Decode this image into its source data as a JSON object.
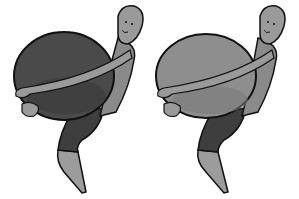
{
  "illustration": {
    "panels": [
      {
        "id": "left",
        "subject": "figure-hugging-dark-ball",
        "colors": {
          "ball": "#4a4a4a",
          "ball_shadow": "#3a3a3a",
          "body": "#8a8a8a",
          "skin": "#9a9a9a",
          "shorts": "#3e3e3e",
          "leg": "#9c9c9c",
          "outline": "#111111"
        }
      },
      {
        "id": "right",
        "subject": "figure-hugging-light-ball",
        "colors": {
          "ball": "#8e8e8e",
          "ball_shadow": "#7a7a7a",
          "body": "#8a8a8a",
          "skin": "#9a9a9a",
          "shorts": "#3e3e3e",
          "leg": "#9c9c9c",
          "outline": "#111111"
        }
      }
    ],
    "background": "#ffffff"
  }
}
